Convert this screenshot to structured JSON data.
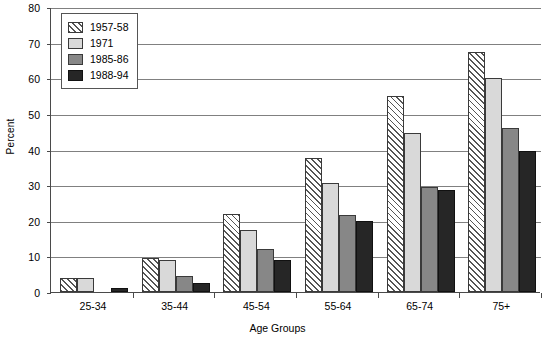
{
  "chart_data": {
    "type": "bar",
    "title": "",
    "xlabel": "Age Groups",
    "ylabel": "Percent",
    "categories": [
      "25-34",
      "35-44",
      "45-54",
      "55-64",
      "65-74",
      "75+"
    ],
    "series": [
      {
        "name": "1957-58",
        "values": [
          4,
          9.5,
          22,
          37.5,
          55,
          67.5
        ]
      },
      {
        "name": "1971",
        "values": [
          4,
          9,
          17.5,
          30.5,
          44.5,
          60
        ]
      },
      {
        "name": "1985-86",
        "values": [
          0,
          4.5,
          12,
          21.5,
          29.5,
          46
        ]
      },
      {
        "name": "1988-94",
        "values": [
          1,
          2.5,
          9,
          20,
          28.5,
          39.5
        ]
      }
    ],
    "ylim": [
      0,
      80
    ],
    "ytick_step": 10,
    "yticks": [
      "0",
      "10",
      "20",
      "30",
      "40",
      "50",
      "60",
      "70",
      "80"
    ],
    "grid": true,
    "legend_position": "top-left",
    "series_colors": [
      "#ffffff",
      "#d9d9d9",
      "#878787",
      "#262626"
    ],
    "series_patterns": [
      "diagonal-hatch",
      "solid",
      "solid",
      "solid"
    ]
  }
}
